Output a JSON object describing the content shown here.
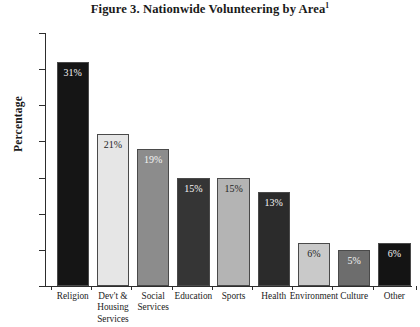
{
  "chart_data": {
    "type": "bar",
    "title": "Figure 3. Nationwide Volunteering by Area",
    "title_superscript": "1",
    "xlabel": "",
    "ylabel": "Percentage",
    "ylim": [
      0,
      35
    ],
    "yticks": [
      0,
      5,
      10,
      15,
      20,
      25,
      30,
      35
    ],
    "grid": false,
    "legend": "none",
    "categories": [
      "Religion",
      "Dev't & Housing Services",
      "Social Services",
      "Education",
      "Sports",
      "Health",
      "Environment",
      "Culture",
      "Other"
    ],
    "category_lines": [
      [
        "Religion"
      ],
      [
        "Dev't &",
        "Housing",
        "Services"
      ],
      [
        "Social",
        "Services"
      ],
      [
        "Education"
      ],
      [
        "Sports"
      ],
      [
        "Health"
      ],
      [
        "Environment"
      ],
      [
        "Culture"
      ],
      [
        "Other"
      ]
    ],
    "values": [
      31,
      21,
      19,
      15,
      15,
      13,
      6,
      5,
      6
    ],
    "value_labels": [
      "31%",
      "21%",
      "19%",
      "15%",
      "15%",
      "13%",
      "6%",
      "5%",
      "6%"
    ],
    "bar_fills": [
      "#151515",
      "#e6e6e6",
      "#8c8c8c",
      "#353535",
      "#b4b4b4",
      "#2b2b2b",
      "#c9c9c9",
      "#6d6d6d",
      "#141414"
    ],
    "bar_label_colors": [
      "#f2f2f2",
      "#242424",
      "#f4f4f4",
      "#f4f4f4",
      "#242424",
      "#f4f4f4",
      "#242424",
      "#f4f4f4",
      "#f4f4f4"
    ],
    "bar_border_color": "#4a4a4a",
    "axis_color": "#2d2d2d",
    "background": "#ffffff"
  }
}
